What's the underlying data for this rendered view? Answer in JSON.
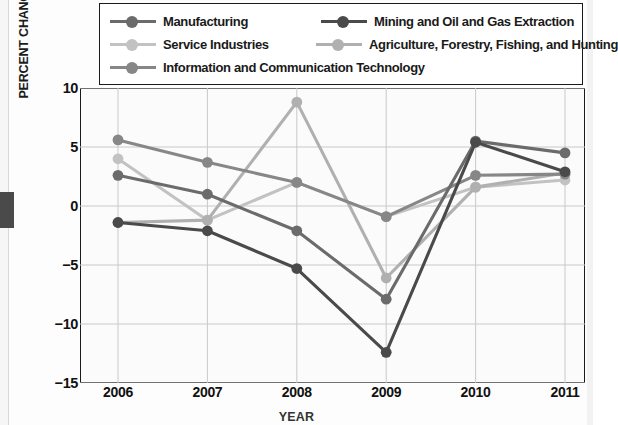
{
  "chart_data": {
    "type": "line",
    "title": "",
    "xlabel": "YEAR",
    "ylabel": "PERCENT CHANGE FROM PREVIOUS YEAR",
    "categories": [
      "2006",
      "2007",
      "2008",
      "2009",
      "2010",
      "2011"
    ],
    "x": [
      2006,
      2007,
      2008,
      2009,
      2010,
      2011
    ],
    "ylim": [
      -15,
      10
    ],
    "yticks": [
      "10",
      "5",
      "0",
      "-5",
      "-10",
      "-15"
    ],
    "ytick_values": [
      10,
      5,
      0,
      -5,
      -10,
      -15
    ],
    "grid": true,
    "legend_position": "top",
    "series": [
      {
        "name": "Manufacturing",
        "color": "#6b6b6b",
        "values": [
          2.6,
          1.0,
          -2.1,
          -7.9,
          5.5,
          4.5
        ]
      },
      {
        "name": "Mining and Oil and Gas Extraction",
        "color": "#4a4a4a",
        "values": [
          -1.4,
          -2.1,
          -5.3,
          -12.4,
          5.4,
          2.9
        ]
      },
      {
        "name": "Service Industries",
        "color": "#c2c2c2",
        "values": [
          4.0,
          -1.2,
          2.0,
          -0.9,
          1.6,
          2.2
        ]
      },
      {
        "name": "Agriculture, Forestry, Fishing, and Hunting",
        "color": "#b0b0b0",
        "values": [
          -1.4,
          -1.2,
          8.8,
          -6.1,
          1.6,
          2.8
        ]
      },
      {
        "name": "Information and Communication Technology",
        "color": "#878787",
        "values": [
          5.6,
          3.7,
          2.0,
          -0.9,
          2.6,
          2.7
        ]
      }
    ],
    "legend_layout": [
      [
        0,
        1
      ],
      [
        2,
        3
      ],
      [
        4
      ]
    ],
    "axis_color": "#1a1a1a",
    "grid_color": "#c9c9c9",
    "plot_background": "#fbfbfb"
  }
}
